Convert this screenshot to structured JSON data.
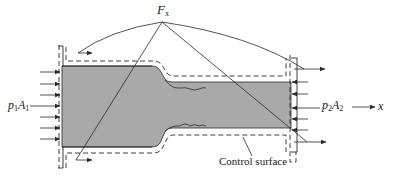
{
  "diagram": {
    "type": "control-volume force diagram (pipe contraction)",
    "labels": {
      "force": {
        "main": "F",
        "sub": "x"
      },
      "inlet": {
        "p": "p",
        "p_sub": "1",
        "a": "A",
        "a_sub": "1"
      },
      "outlet": {
        "p": "p",
        "p_sub": "2",
        "a": "A",
        "a_sub": "2"
      },
      "axis": "x",
      "control_surface": "Control surface"
    },
    "colors": {
      "fluid_fill": "#a9a9a9",
      "line": "#2a2a2a",
      "background": "#ffffff"
    }
  }
}
